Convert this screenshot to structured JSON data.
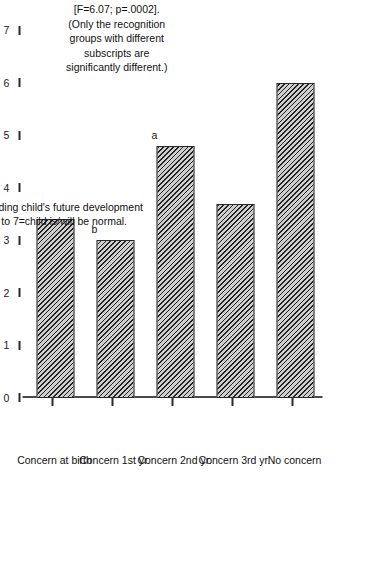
{
  "chart_data": {
    "type": "bar",
    "title": "",
    "orientation": "vertical-bars-on-rotated-page",
    "categories": [
      "Concern at birth",
      "Concern 1st yr.",
      "Concern 2nd yr.",
      "Concern 3rd yr.",
      "No concern"
    ],
    "values": [
      3.4,
      3.0,
      4.8,
      3.7,
      6.0
    ],
    "point_markers": [
      "",
      "b",
      "a",
      "",
      ""
    ],
    "xlabel": "",
    "ylabel": "Average rating of parents' beliefs regarding child's future development on a 7 point scale from 1=uncertain to 7=child is/will be normal.",
    "ylim": [
      0,
      7
    ],
    "yticks": [
      0,
      1,
      2,
      3,
      4,
      5,
      6,
      7
    ],
    "ytick_labels": [
      "0",
      "1",
      "2",
      "3",
      "4",
      "5",
      "6",
      "7"
    ],
    "grid": false,
    "legend": false,
    "annotations": [
      "[F=6.07; p=.0002].",
      "(Only the recognition",
      "groups with different",
      "subscripts are",
      "significantly different.)"
    ]
  },
  "axis": {
    "title_line1": "Average rating of parents' beliefs regarding child's future development",
    "title_line2": "on a 7 point scale from 1=uncertain to 7=child is/will be normal."
  },
  "annotation": {
    "line1": "[F=6.07; p=.0002].",
    "line2": "(Only the recognition",
    "line3": "groups with different",
    "line4": "subscripts are",
    "line5": "significantly different.)"
  },
  "style": {
    "bar_fill": "#cfcfcf",
    "bar_hatch": "#222222",
    "bar_edge": "#2a2a2a",
    "axis_color": "#4a4a4a",
    "text_color": "#1a1a1a",
    "background": "#ffffff"
  }
}
